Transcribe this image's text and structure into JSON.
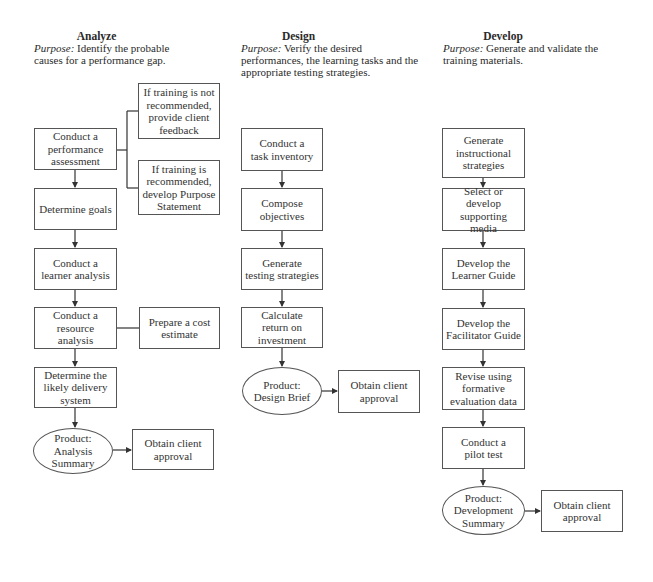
{
  "columns": [
    {
      "id": "analyze",
      "title": "Analyze",
      "purpose_label": "Purpose:",
      "purpose_text": " Identify the probable causes for a performance gap.",
      "steps": [
        "Conduct a\nperformance\nassessment",
        "Determine goals",
        "Conduct a\nlearner analysis",
        "Conduct a\nresource analysis",
        "Determine the\nlikely delivery\nsystem"
      ],
      "side_boxes": [
        "If training is not\nrecommended,\nprovide client\nfeedback",
        "If training is\nrecommended,\ndevelop Purpose\nStatement",
        "Prepare a cost\nestimate"
      ],
      "product": "Product:\nAnalysis\nSummary",
      "approval": "Obtain client\napproval"
    },
    {
      "id": "design",
      "title": "Design",
      "purpose_label": "Purpose:",
      "purpose_text": " Verify the desired performances, the learning tasks and the appropriate testing strategies.",
      "steps": [
        "Conduct a\ntask inventory",
        "Compose\nobjectives",
        "Generate\ntesting strategies",
        "Calculate\nreturn on\ninvestment"
      ],
      "product": "Product:\nDesign Brief",
      "approval": "Obtain client\napproval"
    },
    {
      "id": "develop",
      "title": "Develop",
      "purpose_label": "Purpose:",
      "purpose_text": " Generate and validate the training materials.",
      "steps": [
        "Generate\ninstructional\nstrategies",
        "Select or develop\nsupporting media",
        "Develop the\nLearner Guide",
        "Develop the\nFacilitator Guide",
        "Revise using\nformative\nevaluation data",
        "Conduct a\npilot test"
      ],
      "product": "Product:\nDevelopment\nSummary",
      "approval": "Obtain client\napproval"
    }
  ],
  "colors": {
    "line": "#333333",
    "box_border": "#555555",
    "text": "#333333",
    "background": "#ffffff"
  }
}
